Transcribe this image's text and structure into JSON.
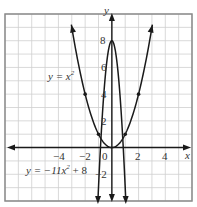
{
  "chart_data": {
    "type": "line",
    "title": "",
    "xlabel": "x",
    "ylabel": "y",
    "xlim": [
      -8,
      6
    ],
    "ylim": [
      -4,
      10
    ],
    "grid": true,
    "x_ticks": [
      {
        "value": -4,
        "label": "−4"
      },
      {
        "value": -2,
        "label": "−2"
      },
      {
        "value": 0,
        "label": "0"
      },
      {
        "value": 2,
        "label": "2"
      },
      {
        "value": 4,
        "label": "4"
      }
    ],
    "y_ticks": [
      {
        "value": 8,
        "label": "8"
      },
      {
        "value": 6,
        "label": "6"
      },
      {
        "value": 4,
        "label": "4"
      },
      {
        "value": 2,
        "label": "2"
      },
      {
        "value": -2,
        "label": "−2"
      }
    ],
    "series": [
      {
        "name": "y = x²",
        "label_prefix": "y = x",
        "label_sup": "2",
        "points": [
          [
            -2,
            4
          ],
          [
            -1,
            1
          ],
          [
            0,
            0
          ],
          [
            1,
            1
          ],
          [
            2,
            4
          ]
        ]
      },
      {
        "name": "y = −11x² + 8",
        "label_prefix": "y = −11x",
        "label_sup": "2",
        "label_suffix": " + 8",
        "points": [
          [
            -1,
            -3
          ],
          [
            0,
            8
          ],
          [
            1,
            -3
          ]
        ]
      }
    ],
    "marked_points": [
      [
        -2,
        4
      ],
      [
        -1,
        1
      ],
      [
        1,
        1
      ],
      [
        2,
        4
      ]
    ],
    "colors": {
      "curve": "#1a1a1a",
      "grid": "#cfcfcf",
      "frame": "#8a8a8a"
    }
  }
}
